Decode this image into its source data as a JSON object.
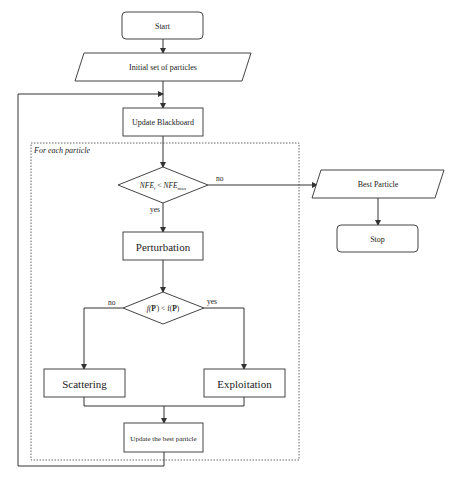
{
  "diagram": {
    "type": "flowchart",
    "container_label": "For each particle",
    "nodes": {
      "start": "Start",
      "initial": "Initial set of particles",
      "update_blackboard": "Update Blackboard",
      "condition_nfe": "NFE_i < NFE_max",
      "condition_nfe_lhs": "NFE",
      "condition_nfe_lhs_sub": "i",
      "condition_nfe_op": "<",
      "condition_nfe_rhs": "NFE",
      "condition_nfe_rhs_sub": "max",
      "perturbation": "Perturbation",
      "condition_f": "f(P') < f(P)",
      "condition_f_left": "f(",
      "condition_f_p1": "P",
      "condition_f_prime": "'",
      "condition_f_mid": ") < f(",
      "condition_f_p2": "P",
      "condition_f_end": ")",
      "scattering": "Scattering",
      "exploitation": "Exploitation",
      "update_best": "Update the best particle",
      "best_particle": "Best Particle",
      "stop": "Stop"
    },
    "edge_labels": {
      "nfe_yes": "yes",
      "nfe_no": "no",
      "f_yes": "yes",
      "f_no": "no"
    },
    "edges": [
      {
        "from": "start",
        "to": "initial"
      },
      {
        "from": "initial",
        "to": "update_blackboard"
      },
      {
        "from": "update_blackboard",
        "to": "condition_nfe"
      },
      {
        "from": "condition_nfe",
        "to": "perturbation",
        "label": "yes"
      },
      {
        "from": "condition_nfe",
        "to": "best_particle",
        "label": "no"
      },
      {
        "from": "best_particle",
        "to": "stop"
      },
      {
        "from": "perturbation",
        "to": "condition_f"
      },
      {
        "from": "condition_f",
        "to": "scattering",
        "label": "no"
      },
      {
        "from": "condition_f",
        "to": "exploitation",
        "label": "yes"
      },
      {
        "from": "scattering",
        "to": "update_best"
      },
      {
        "from": "exploitation",
        "to": "update_best"
      },
      {
        "from": "update_best",
        "to": "update_blackboard",
        "label": "loop"
      }
    ]
  }
}
